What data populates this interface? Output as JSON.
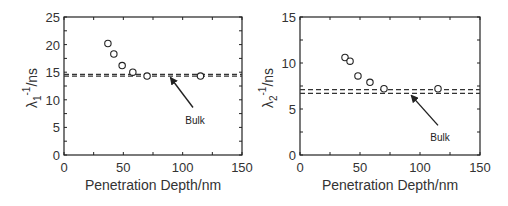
{
  "chart_data": [
    {
      "type": "scatter",
      "title": "",
      "xlabel": "Penetration Depth/nm",
      "ylabel": "λ1⁻¹/ns",
      "ylabel_parts": {
        "symbol": "λ",
        "sub": "1",
        "sup": "-1",
        "unit": "/ns"
      },
      "xlim": [
        0,
        150
      ],
      "ylim": [
        0,
        25
      ],
      "xticks": [
        0,
        50,
        100,
        150
      ],
      "yticks": [
        0,
        5,
        10,
        15,
        20,
        25
      ],
      "grid": false,
      "marker": "open-circle",
      "series": [
        {
          "name": "data",
          "x": [
            37,
            42,
            49,
            58,
            70,
            115
          ],
          "y": [
            20.2,
            18.3,
            16.2,
            15.0,
            14.3,
            14.3
          ]
        }
      ],
      "reference_lines": [
        {
          "name": "Bulk upper",
          "y": 14.6,
          "style": "dashed"
        },
        {
          "name": "Bulk lower",
          "y": 14.3,
          "style": "dashed"
        }
      ],
      "annotations": [
        {
          "text": "Bulk",
          "arrow_to": [
            88,
            14.4
          ]
        }
      ]
    },
    {
      "type": "scatter",
      "title": "",
      "xlabel": "Penetration Depth/nm",
      "ylabel": "λ2⁻¹/ns",
      "ylabel_parts": {
        "symbol": "λ",
        "sub": "2",
        "sup": "-1",
        "unit": "/ns"
      },
      "xlim": [
        0,
        150
      ],
      "ylim": [
        0,
        15
      ],
      "xticks": [
        0,
        50,
        100,
        150
      ],
      "yticks": [
        0,
        5,
        10,
        15
      ],
      "grid": false,
      "marker": "open-circle",
      "series": [
        {
          "name": "data",
          "x": [
            37.5,
            41.7,
            48.3,
            58.3,
            70,
            115
          ],
          "y": [
            10.6,
            10.2,
            8.6,
            7.9,
            7.2,
            7.2
          ]
        }
      ],
      "reference_lines": [
        {
          "name": "Bulk upper",
          "y": 7.1,
          "style": "dashed"
        },
        {
          "name": "Bulk lower",
          "y": 6.7,
          "style": "dashed"
        }
      ],
      "annotations": [
        {
          "text": "Bulk",
          "arrow_to": [
            91,
            6.7
          ]
        }
      ]
    }
  ]
}
